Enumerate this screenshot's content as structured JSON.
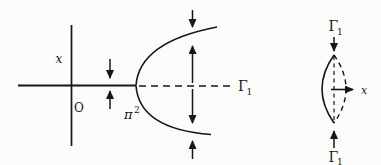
{
  "colors": {
    "background": "#fbfbf9",
    "ink": "#161616"
  },
  "left_diagram": {
    "vertical_axis_label": "x",
    "origin_label": "O",
    "bifurcation_point_label_base": "π",
    "bifurcation_point_label_sup": "2",
    "branch_label_base": "Γ",
    "branch_label_sub": "1"
  },
  "right_diagram": {
    "top_label_base": "Γ",
    "top_label_sub": "1",
    "bottom_label_base": "Γ",
    "bottom_label_sub": "1",
    "axis_label": "x"
  }
}
